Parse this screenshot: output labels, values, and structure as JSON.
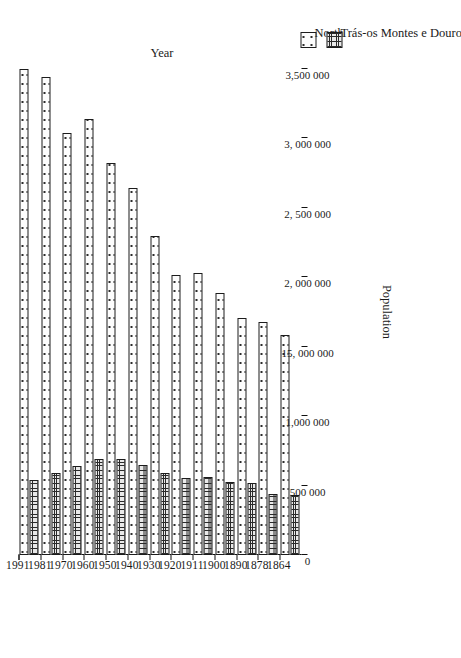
{
  "chart_data": {
    "type": "bar",
    "orientation": "horizontal-rotated",
    "title": "",
    "xlabel": "Year",
    "ylabel": "Population",
    "grid": false,
    "legend_position": "right",
    "categories": [
      "1864",
      "1878",
      "1890",
      "1900",
      "1911",
      "1920",
      "1930",
      "1940",
      "1950",
      "1960",
      "1970",
      "1981",
      "1991"
    ],
    "ylim": [
      0,
      3500000
    ],
    "ytick_labels": [
      "0",
      "500 000",
      "1,000 000",
      "15, 000 000",
      "2, 000 000",
      "2, 500 000",
      "3, 000 000",
      "3,500 000"
    ],
    "ytick_values": [
      0,
      500000,
      1000000,
      1500000,
      2000000,
      2500000,
      3000000,
      3500000
    ],
    "series": [
      {
        "name": "North",
        "pattern": "sparse-dots",
        "values": [
          1585000,
          1680000,
          1705000,
          1890000,
          2030000,
          2015000,
          2300000,
          2640000,
          2820000,
          3140000,
          3040000,
          3440000,
          3500000
        ]
      },
      {
        "name": "Trás-os Montes e Douro",
        "pattern": "dense-grid",
        "values": [
          430000,
          440000,
          515000,
          525000,
          565000,
          555000,
          590000,
          650000,
          690000,
          690000,
          640000,
          590000,
          540000
        ]
      }
    ]
  },
  "legend": {
    "items": [
      {
        "label": "North",
        "swatch": "north-swatch-icon"
      },
      {
        "label": "Trás-os Montes e Douro",
        "swatch": "tmd-swatch-icon"
      }
    ]
  },
  "axes": {
    "category_title": "Year",
    "value_title": "Population"
  }
}
